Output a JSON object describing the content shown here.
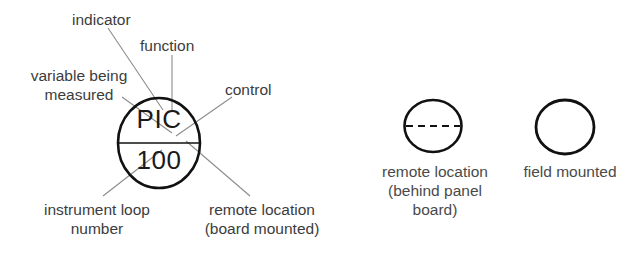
{
  "diagram": {
    "main_symbol": {
      "name": "instrument-balloon",
      "tag_function": "PIC",
      "tag_number": "100",
      "shape": "circle-with-solid-horizontal-line",
      "line_color": "#111111"
    },
    "annotations": [
      {
        "id": "indicator",
        "text": "indicator"
      },
      {
        "id": "function",
        "text": "function"
      },
      {
        "id": "variable",
        "text": "variable being\nmeasured"
      },
      {
        "id": "control",
        "text": "control"
      },
      {
        "id": "loop_number",
        "text": "instrument loop\nnumber"
      },
      {
        "id": "remote_board",
        "text": "remote location\n(board mounted)"
      }
    ],
    "reference_symbols": [
      {
        "id": "remote-panel",
        "shape": "circle-with-dashed-horizontal-line",
        "label": "remote location\n(behind panel\nboard)"
      },
      {
        "id": "field-mounted",
        "shape": "plain-circle",
        "label": "field mounted"
      }
    ],
    "colors": {
      "stroke": "#111111",
      "leader": "#8c8c8c",
      "text": "#3c3c3c",
      "background": "#ffffff"
    }
  }
}
